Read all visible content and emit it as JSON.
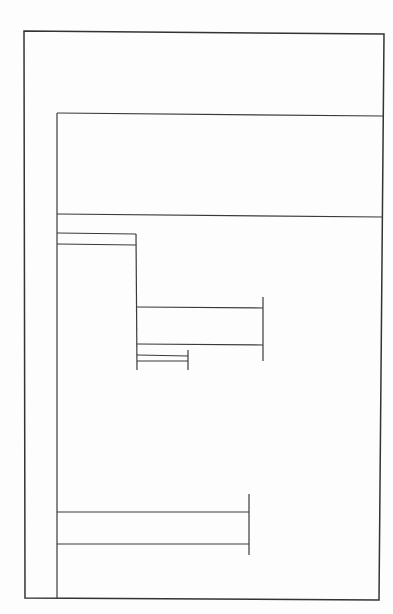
{
  "diagram": {
    "kind": "line-drawing",
    "line_color": "#3a3a3a",
    "background_color": "#fdfdfd",
    "text_labels": [],
    "regions": [
      {
        "id": "outer-frame",
        "type": "rectangle"
      },
      {
        "id": "inner-frame",
        "type": "rectangle"
      },
      {
        "id": "header-panel",
        "type": "panel"
      },
      {
        "id": "bar-1",
        "type": "bar",
        "level": 1
      },
      {
        "id": "bar-2",
        "type": "bar",
        "level": 2
      },
      {
        "id": "bar-3",
        "type": "bar",
        "level": 3
      },
      {
        "id": "bar-4",
        "type": "bar",
        "level": 1
      }
    ]
  }
}
